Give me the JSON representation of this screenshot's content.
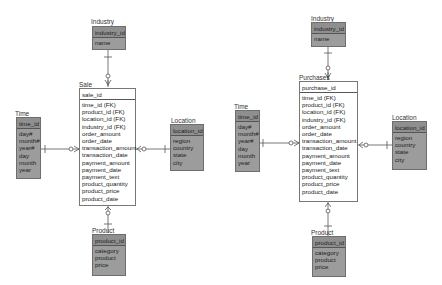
{
  "diagrams": [
    {
      "name": "sale",
      "industry": {
        "title": "Industry",
        "key": "industry_id",
        "attrs": [
          "name"
        ]
      },
      "fact": {
        "title": "Sale",
        "key": "sale_id",
        "attrs": [
          "time_id (FK)",
          "product_id (FK)",
          "location_id (FK)",
          "industry_id (FK)",
          "order_amount",
          "order_date",
          "transaction_amount",
          "transaction_date",
          "payment_amount",
          "payment_date",
          "payment_text",
          "product_quantity",
          "product_price",
          "product_date"
        ]
      },
      "time": {
        "title": "Time",
        "key": "time_id",
        "attrs": [
          "day#",
          "month#",
          "year#",
          "day",
          "month",
          "year"
        ]
      },
      "location": {
        "title": "Location",
        "key": "location_id",
        "attrs": [
          "region",
          "country",
          "state",
          "city"
        ]
      },
      "product": {
        "title": "Product",
        "key": "product_id",
        "attrs": [
          "category",
          "product",
          "price"
        ]
      }
    },
    {
      "name": "purchases",
      "industry": {
        "title": "Industry",
        "key": "industry_id",
        "attrs": [
          "name"
        ]
      },
      "fact": {
        "title": "Purchases",
        "key": "purchase_id",
        "attrs": [
          "time_id (FK)",
          "product_id (FK)",
          "location_id (FK)",
          "industry_id (FK)",
          "order_amount",
          "order_date",
          "transaction_amount",
          "transaction_date",
          "payment_amount",
          "payment_date",
          "payment_text",
          "product_quantity",
          "product_price",
          "product_date"
        ]
      },
      "time": {
        "title": "Time",
        "key": "time_id",
        "attrs": [
          "day#",
          "month#",
          "year#",
          "day",
          "month",
          "year"
        ]
      },
      "location": {
        "title": "Location",
        "key": "location_id",
        "attrs": [
          "region",
          "country",
          "state",
          "city"
        ]
      },
      "product": {
        "title": "Product",
        "key": "product_id",
        "attrs": [
          "category",
          "product",
          "price"
        ]
      }
    }
  ],
  "colors": {
    "dimension_fill": "#9c9c9c",
    "dimension_header": "#8f8f8f",
    "fact_fill": "#ffffff",
    "line": "#555555"
  }
}
